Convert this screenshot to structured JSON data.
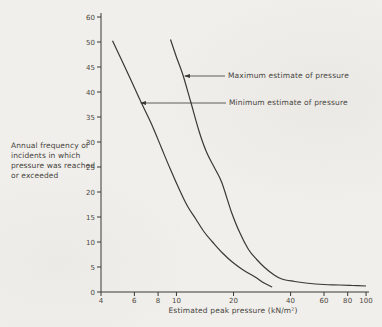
{
  "figure": {
    "background": "#f0efeb",
    "line_color": "#3a3833",
    "text_color": "#4c4842"
  },
  "chart_data": {
    "type": "line",
    "x_scale": "log",
    "y_scale": "linear-compressed-above-50",
    "grid": false,
    "xlabel": "Estimated peak pressure (kN/m²)",
    "ylabel": "Annual frequency of\nincidents in which\npressure was reached\nor exceeded",
    "xlim": [
      4,
      100
    ],
    "ylim": [
      0,
      60
    ],
    "x_ticks": [
      "4",
      "6",
      "8",
      "10",
      "20",
      "40",
      "60",
      "80",
      "100"
    ],
    "y_ticks": [
      "60",
      "50",
      "45",
      "40",
      "35",
      "30",
      "25",
      "20",
      "15",
      "10",
      "5",
      "0"
    ],
    "y_tick_values": [
      60,
      50,
      45,
      40,
      35,
      30,
      25,
      20,
      15,
      10,
      5,
      0
    ],
    "x_tick_values": [
      4,
      6,
      8,
      10,
      20,
      40,
      60,
      80,
      100
    ],
    "legend_position": "inline-annotations",
    "series": [
      {
        "name": "Maximum estimate of pressure",
        "points": [
          [
            9.3,
            51
          ],
          [
            10,
            47
          ],
          [
            10.8,
            43.5
          ],
          [
            11.9,
            38
          ],
          [
            13.2,
            32
          ],
          [
            14.4,
            28
          ],
          [
            15.8,
            25
          ],
          [
            17.3,
            22
          ],
          [
            19.5,
            16
          ],
          [
            21.5,
            12
          ],
          [
            24,
            8.5
          ],
          [
            26.5,
            6.5
          ],
          [
            29,
            5
          ],
          [
            32.5,
            3.5
          ],
          [
            36,
            2.6
          ],
          [
            42,
            2.1
          ],
          [
            48,
            1.8
          ],
          [
            60,
            1.5
          ],
          [
            72,
            1.4
          ],
          [
            85,
            1.3
          ],
          [
            100,
            1.2
          ]
        ]
      },
      {
        "name": "Minimum estimate of pressure",
        "points": [
          [
            4.6,
            50.5
          ],
          [
            5.5,
            44
          ],
          [
            6.5,
            38
          ],
          [
            7.4,
            33.5
          ],
          [
            8.3,
            29
          ],
          [
            9.3,
            24.5
          ],
          [
            10.5,
            20
          ],
          [
            11.5,
            17
          ],
          [
            12.7,
            14.5
          ],
          [
            14,
            12
          ],
          [
            15.5,
            10
          ],
          [
            17.5,
            7.8
          ],
          [
            19.7,
            6
          ],
          [
            22.5,
            4.4
          ],
          [
            26,
            3
          ],
          [
            29,
            1.8
          ],
          [
            32,
            1
          ]
        ]
      }
    ],
    "annotations": [
      {
        "label": "Maximum estimate of pressure"
      },
      {
        "label": "Minimum estimate of pressure"
      }
    ]
  }
}
